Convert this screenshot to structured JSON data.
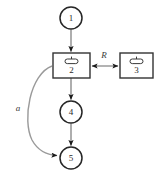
{
  "diagram": {
    "type": "node-link-diagram",
    "background_color": "#ffffff",
    "node_stroke_color": "#262626",
    "box_stroke_color": "#333333",
    "edge_color": "#9a9a9a",
    "arrowhead_color": "#1a1a1a",
    "label_color": "#2b2b2b",
    "nodes": [
      {
        "id": "1",
        "label": "1",
        "shape": "circle",
        "cx": 71,
        "cy": 18,
        "r": 11
      },
      {
        "id": "2",
        "label": "2",
        "shape": "box",
        "icon": "capsule-icon",
        "x": 53,
        "y": 53,
        "width": 37,
        "height": 25
      },
      {
        "id": "3",
        "label": "3",
        "shape": "box",
        "icon": "capsule-icon",
        "x": 120,
        "y": 53,
        "width": 33,
        "height": 25
      },
      {
        "id": "4",
        "label": "4",
        "shape": "circle",
        "cx": 71,
        "cy": 112,
        "r": 11
      },
      {
        "id": "5",
        "label": "5",
        "shape": "circle",
        "cx": 71,
        "cy": 158,
        "r": 11
      }
    ],
    "edges": [
      {
        "id": "e1",
        "from": "1",
        "to": "2",
        "label": "",
        "style": "straight",
        "direction": "single"
      },
      {
        "id": "e2",
        "from": "2",
        "to": "3",
        "label": "R",
        "style": "straight",
        "direction": "double"
      },
      {
        "id": "e3",
        "from": "2",
        "to": "4",
        "label": "",
        "style": "straight",
        "direction": "single"
      },
      {
        "id": "e4",
        "from": "4",
        "to": "5",
        "label": "",
        "style": "straight",
        "direction": "single"
      },
      {
        "id": "e5",
        "from": "2",
        "to": "5",
        "label": "a",
        "style": "curved",
        "direction": "single"
      }
    ],
    "edge_labels": {
      "relation_R": "R",
      "relation_a": "a"
    }
  }
}
